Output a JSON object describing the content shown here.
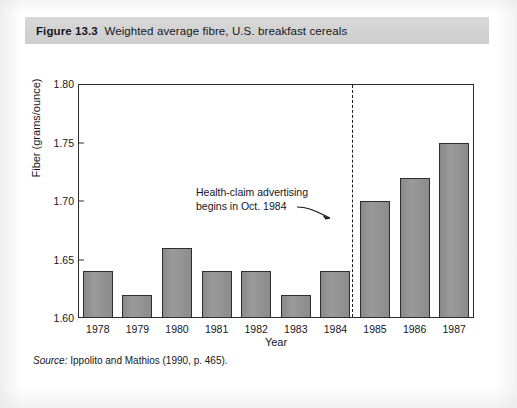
{
  "figure": {
    "number_label": "Figure 13.3",
    "caption": "Weighted average fibre, U.S. breakfast cereals",
    "source_label": "Source:",
    "source_text": " Ippolito and Mathios (1990, p. 465)."
  },
  "colors": {
    "caption_background": "#d4d4d4",
    "bar_fill": "#8e8e8e",
    "bar_border": "#2e2e2e",
    "axis": "#2b2b2b",
    "text": "#15161a",
    "page_background": "#ffffff"
  },
  "chart_data": {
    "type": "bar",
    "title": "Weighted average fibre, U.S. breakfast cereals",
    "xlabel": "Year",
    "ylabel": "Fiber (grams/ounce)",
    "categories": [
      "1978",
      "1979",
      "1980",
      "1981",
      "1982",
      "1983",
      "1984",
      "1985",
      "1986",
      "1987"
    ],
    "values": [
      1.64,
      1.62,
      1.66,
      1.64,
      1.64,
      1.62,
      1.64,
      1.7,
      1.72,
      1.75
    ],
    "ylim": [
      1.6,
      1.8
    ],
    "yticks": [
      "1.60",
      "1.65",
      "1.70",
      "1.75",
      "1.80"
    ],
    "ytick_values": [
      1.6,
      1.65,
      1.7,
      1.75,
      1.8
    ],
    "grid": false,
    "legend": null,
    "annotations": [
      {
        "text_line_1": "Health-claim advertising",
        "text_line_2": "begins in Oct. 1984",
        "marker_type": "vertical-dashed-line",
        "marker_at_category": "1984",
        "arrow": "points-right-to-dashed-line"
      }
    ]
  }
}
